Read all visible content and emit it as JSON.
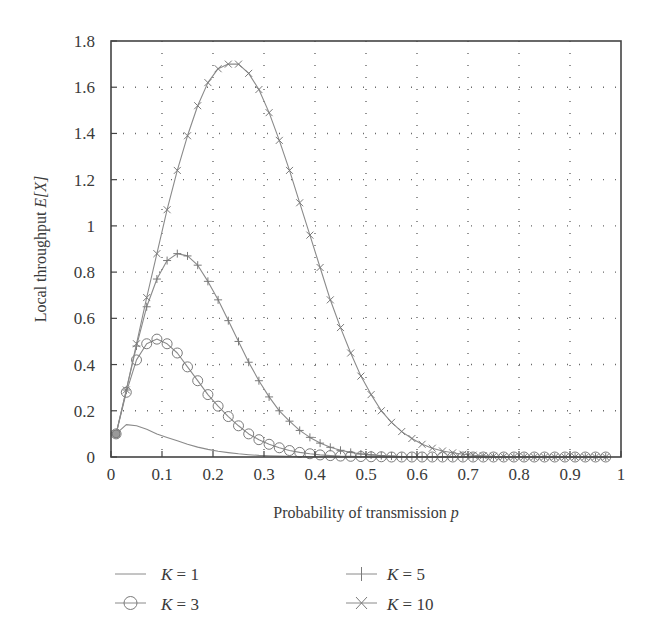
{
  "chart_data": {
    "type": "line",
    "title": "",
    "xlabel": "Probability of transmission p",
    "xlabel_main": "Probability of transmission ",
    "xlabel_var": "p",
    "ylabel": "Local throughput E[X]",
    "ylabel_main": "Local throughput ",
    "ylabel_var": "E[X]",
    "xlim": [
      0,
      1
    ],
    "ylim": [
      0,
      1.8
    ],
    "xticks": [
      "0",
      "0.1",
      "0.2",
      "0.3",
      "0.4",
      "0.5",
      "0.6",
      "0.7",
      "0.8",
      "0.9",
      "1"
    ],
    "yticks": [
      "0",
      "0.2",
      "0.4",
      "0.6",
      "0.8",
      "1",
      "1.2",
      "1.4",
      "1.6",
      "1.8"
    ],
    "grid": true,
    "legend_position": "below",
    "x": [
      0.01,
      0.03,
      0.05,
      0.07,
      0.09,
      0.11,
      0.13,
      0.15,
      0.17,
      0.19,
      0.21,
      0.23,
      0.25,
      0.27,
      0.29,
      0.31,
      0.33,
      0.35,
      0.37,
      0.39,
      0.41,
      0.43,
      0.45,
      0.47,
      0.49,
      0.51,
      0.53,
      0.55,
      0.57,
      0.59,
      0.61,
      0.63,
      0.65,
      0.67,
      0.69,
      0.71,
      0.73,
      0.75,
      0.77,
      0.79,
      0.81,
      0.83,
      0.85,
      0.87,
      0.89,
      0.91,
      0.93,
      0.95,
      0.97
    ],
    "series": [
      {
        "name": "K = 1",
        "marker": "none",
        "values": [
          0.1,
          0.14,
          0.135,
          0.12,
          0.1,
          0.085,
          0.07,
          0.055,
          0.043,
          0.033,
          0.025,
          0.019,
          0.014,
          0.01,
          0.007,
          0.005,
          0.004,
          0.003,
          0.002,
          0.001,
          0.001,
          0.001,
          0,
          0,
          0,
          0,
          0,
          0,
          0,
          0,
          0,
          0,
          0,
          0,
          0,
          0,
          0,
          0,
          0,
          0,
          0,
          0,
          0,
          0,
          0,
          0,
          0,
          0,
          0
        ]
      },
      {
        "name": "K = 3",
        "marker": "circle",
        "values": [
          0.1,
          0.28,
          0.42,
          0.49,
          0.51,
          0.49,
          0.45,
          0.39,
          0.33,
          0.27,
          0.22,
          0.175,
          0.135,
          0.1,
          0.075,
          0.055,
          0.04,
          0.028,
          0.02,
          0.014,
          0.009,
          0.006,
          0.004,
          0.003,
          0.002,
          0.001,
          0.001,
          0,
          0,
          0,
          0,
          0,
          0,
          0,
          0,
          0,
          0,
          0,
          0,
          0,
          0,
          0,
          0,
          0,
          0,
          0,
          0,
          0,
          0
        ]
      },
      {
        "name": "K = 5",
        "marker": "plus",
        "values": [
          0.1,
          0.29,
          0.48,
          0.65,
          0.77,
          0.85,
          0.88,
          0.87,
          0.83,
          0.76,
          0.68,
          0.59,
          0.5,
          0.41,
          0.33,
          0.26,
          0.2,
          0.155,
          0.115,
          0.085,
          0.06,
          0.042,
          0.029,
          0.02,
          0.013,
          0.009,
          0.006,
          0.004,
          0.002,
          0.001,
          0.001,
          0,
          0,
          0,
          0,
          0,
          0,
          0,
          0,
          0,
          0,
          0,
          0,
          0,
          0,
          0,
          0,
          0,
          0
        ]
      },
      {
        "name": "K = 10",
        "marker": "x",
        "values": [
          0.1,
          0.29,
          0.49,
          0.69,
          0.88,
          1.07,
          1.24,
          1.39,
          1.52,
          1.62,
          1.68,
          1.7,
          1.7,
          1.66,
          1.59,
          1.49,
          1.37,
          1.24,
          1.1,
          0.96,
          0.82,
          0.68,
          0.56,
          0.45,
          0.35,
          0.27,
          0.2,
          0.15,
          0.11,
          0.08,
          0.055,
          0.038,
          0.026,
          0.018,
          0.012,
          0.008,
          0.005,
          0.003,
          0.002,
          0.001,
          0.001,
          0,
          0,
          0,
          0,
          0,
          0,
          0,
          0
        ]
      }
    ]
  },
  "legend": {
    "items": [
      {
        "prefix": "K",
        "suffix": " = 1",
        "marker": "none"
      },
      {
        "prefix": "K",
        "suffix": " = 5",
        "marker": "plus"
      },
      {
        "prefix": "K",
        "suffix": " = 3",
        "marker": "circle"
      },
      {
        "prefix": "K",
        "suffix": " = 10",
        "marker": "x"
      }
    ]
  },
  "colors": {
    "curve": "#8a8a8a",
    "marker": "#7a7a7a",
    "frame": "#444444",
    "grid": "#6a6a6a",
    "text": "#3a3a3a"
  }
}
